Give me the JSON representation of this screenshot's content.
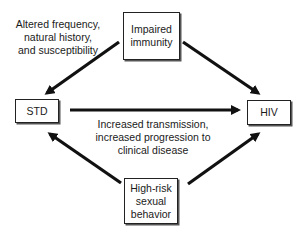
{
  "diagram": {
    "type": "causal-relationship",
    "nodes": {
      "top": {
        "label": "Impaired\nimmunity"
      },
      "left": {
        "label": "STD"
      },
      "right": {
        "label": "HIV"
      },
      "bottom": {
        "label": "High-risk\nsexual\nbehavior"
      }
    },
    "edges": [
      {
        "from": "top",
        "to": "left"
      },
      {
        "from": "top",
        "to": "right"
      },
      {
        "from": "left",
        "to": "right"
      },
      {
        "from": "bottom",
        "to": "left"
      },
      {
        "from": "bottom",
        "to": "right"
      }
    ],
    "annotations": {
      "top_left": "Altered frequency,\nnatural history,\nand susceptibility",
      "center": "Increased transmission,\nincreased progression to\nclinical disease"
    },
    "colors": {
      "stroke": "#111111",
      "background": "#ffffff",
      "text": "#1a1a1a"
    }
  }
}
